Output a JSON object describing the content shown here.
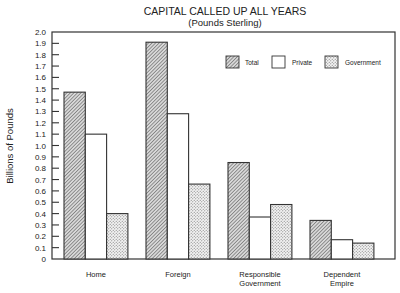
{
  "chart_data": {
    "type": "bar",
    "title": "CAPITAL CALLED UP ALL YEARS",
    "subtitle": "(Pounds Sterling)",
    "xlabel": "",
    "ylabel": "Billions of Pounds",
    "ylim": [
      0,
      2.0
    ],
    "yticks": [
      0,
      0.1,
      0.2,
      0.3,
      0.4,
      0.5,
      0.6,
      0.7,
      0.8,
      0.9,
      1.0,
      1.1,
      1.2,
      1.3,
      1.4,
      1.5,
      1.6,
      1.7,
      1.8,
      1.9,
      2.0
    ],
    "ytick_labels": [
      "0",
      "0.1",
      "0.2",
      "0.3",
      "0.4",
      "0.5",
      "0.6",
      "0.7",
      "0.8",
      "0.9",
      "1.0",
      "1.1",
      "1.2",
      "1.3",
      "1.4",
      "1.5",
      "1.6",
      "1.7",
      "1.8",
      "1.9",
      "2.0"
    ],
    "categories": [
      [
        "Home"
      ],
      [
        "Foreign"
      ],
      [
        "Responsible",
        "Government"
      ],
      [
        "Dependent",
        "Empire"
      ]
    ],
    "series": [
      {
        "name": "Total",
        "pattern": "diagonal-hatch",
        "values": [
          1.47,
          1.91,
          0.85,
          0.34
        ]
      },
      {
        "name": "Private",
        "pattern": "none",
        "values": [
          1.1,
          1.28,
          0.37,
          0.17
        ]
      },
      {
        "name": "Government",
        "pattern": "dots",
        "values": [
          0.4,
          0.66,
          0.48,
          0.14
        ]
      }
    ],
    "legend": {
      "position": "top-right",
      "entries": [
        "Total",
        "Private",
        "Government"
      ]
    },
    "grid": false
  }
}
